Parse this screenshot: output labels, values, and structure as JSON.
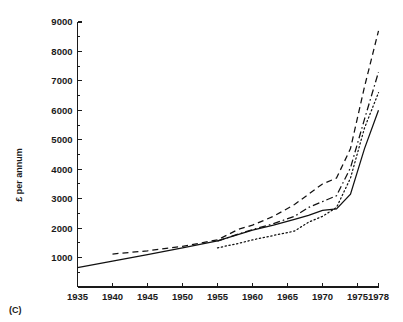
{
  "figure": {
    "panel_label": "(C)",
    "background_color": "#ffffff",
    "line_color": "#111111"
  },
  "chart_data": {
    "type": "line",
    "title": "",
    "xlabel": "",
    "ylabel": "£ per annum",
    "xlim": [
      1935,
      1978
    ],
    "ylim": [
      0,
      9000
    ],
    "grid": false,
    "legend": null,
    "x_ticks": [
      1935,
      1940,
      1945,
      1950,
      1955,
      1960,
      1965,
      1970,
      1975,
      1978
    ],
    "x_tick_labels": [
      "1935",
      "1940",
      "1945",
      "1950",
      "1955",
      "1960",
      "1965",
      "1970",
      "1975",
      "1978"
    ],
    "y_ticks": [
      1000,
      2000,
      3000,
      4000,
      5000,
      6000,
      7000,
      8000,
      9000
    ],
    "y_tick_labels": [
      "1000",
      "2000",
      "3000",
      "4000",
      "5000",
      "6000",
      "7000",
      "8000",
      "9000"
    ],
    "y_minor_ticks": [
      500,
      1500,
      2500,
      3500,
      4500,
      5500,
      6500,
      7500,
      8500
    ],
    "series": [
      {
        "name": "series-solid",
        "style": "solid",
        "x": [
          1935,
          1940,
          1945,
          1950,
          1955,
          1960,
          1963,
          1966,
          1968,
          1970,
          1972,
          1974,
          1976,
          1978
        ],
        "values": [
          660,
          880,
          1100,
          1330,
          1570,
          1930,
          2100,
          2300,
          2430,
          2600,
          2650,
          3150,
          4700,
          6000
        ]
      },
      {
        "name": "series-dashed",
        "style": "dashed",
        "x": [
          1940,
          1945,
          1950,
          1955,
          1958,
          1960,
          1963,
          1966,
          1968,
          1970,
          1972,
          1974,
          1976,
          1978
        ],
        "values": [
          1120,
          1230,
          1380,
          1600,
          1960,
          2100,
          2400,
          2800,
          3150,
          3500,
          3700,
          4700,
          6800,
          8700
        ]
      },
      {
        "name": "series-dashdot",
        "style": "dashdot",
        "x": [
          1955,
          1958,
          1960,
          1963,
          1966,
          1968,
          1970,
          1972,
          1974,
          1976,
          1978
        ],
        "values": [
          1560,
          1800,
          1950,
          2150,
          2400,
          2700,
          2900,
          3100,
          4050,
          5700,
          7300
        ]
      },
      {
        "name": "series-dotted",
        "style": "dotted",
        "x": [
          1955,
          1958,
          1960,
          1963,
          1966,
          1968,
          1970,
          1972,
          1974,
          1976,
          1978
        ],
        "values": [
          1330,
          1480,
          1600,
          1750,
          1900,
          2200,
          2400,
          2700,
          3700,
          5400,
          6600
        ]
      }
    ]
  }
}
